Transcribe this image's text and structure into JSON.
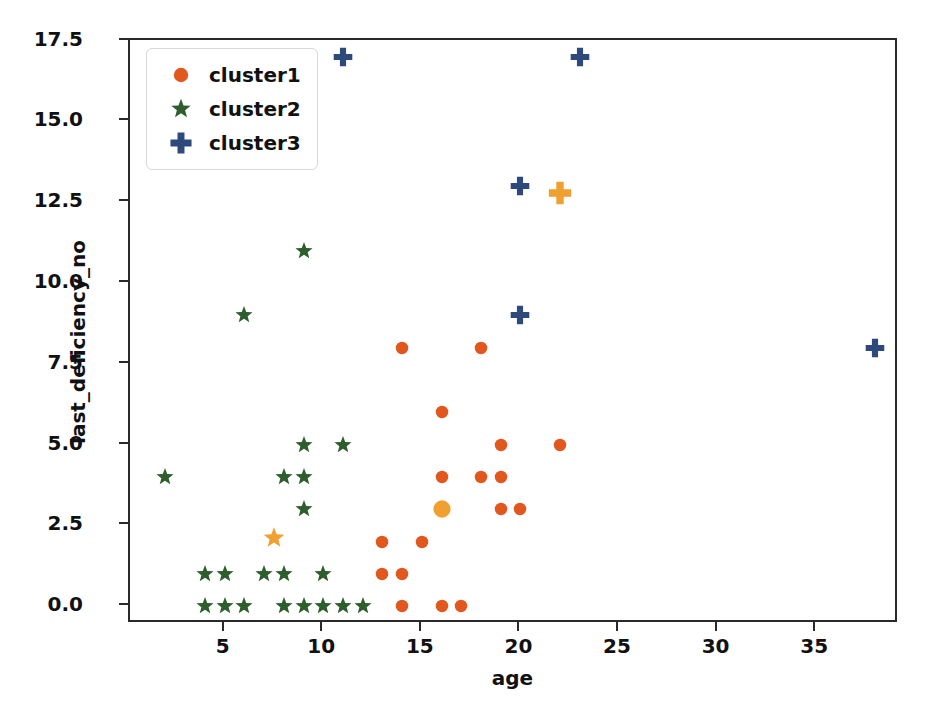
{
  "chart_data": {
    "type": "scatter",
    "title": "",
    "xlabel": "age",
    "ylabel": "last_deficiency_no",
    "xlim": [
      0.2,
      39.2
    ],
    "ylim": [
      -0.55,
      17.52
    ],
    "grid": false,
    "legend_position": "upper left",
    "xticks": [
      5,
      10,
      15,
      20,
      25,
      30,
      35
    ],
    "yticks": [
      "0.0",
      "2.5",
      "5.0",
      "7.5",
      "10.0",
      "12.5",
      "15.0",
      "17.5"
    ],
    "ytick_values": [
      0.0,
      2.5,
      5.0,
      7.5,
      10.0,
      12.5,
      15.0,
      17.5
    ],
    "series": [
      {
        "name": "cluster1",
        "marker": "circle",
        "color": "#e2571e",
        "size": 13,
        "points": [
          [
            14,
            8
          ],
          [
            18,
            8
          ],
          [
            16,
            6
          ],
          [
            19,
            5
          ],
          [
            22,
            5
          ],
          [
            16,
            4
          ],
          [
            18,
            4
          ],
          [
            19,
            4
          ],
          [
            19,
            3
          ],
          [
            20,
            3
          ],
          [
            13,
            2
          ],
          [
            15,
            2
          ],
          [
            13,
            1
          ],
          [
            14,
            1
          ],
          [
            14,
            0
          ],
          [
            16,
            0
          ],
          [
            17,
            0
          ]
        ]
      },
      {
        "name": "cluster2",
        "marker": "star",
        "color": "#2e5e2e",
        "size": 15,
        "points": [
          [
            9,
            11
          ],
          [
            6,
            9
          ],
          [
            9,
            5
          ],
          [
            11,
            5
          ],
          [
            8,
            4
          ],
          [
            9,
            4
          ],
          [
            2,
            4
          ],
          [
            9,
            3
          ],
          [
            4,
            1
          ],
          [
            5,
            1
          ],
          [
            7,
            1
          ],
          [
            8,
            1
          ],
          [
            10,
            1
          ],
          [
            4,
            0
          ],
          [
            5,
            0
          ],
          [
            6,
            0
          ],
          [
            8,
            0
          ],
          [
            9,
            0
          ],
          [
            10,
            0
          ],
          [
            11,
            0
          ],
          [
            12,
            0
          ]
        ]
      },
      {
        "name": "cluster3",
        "marker": "plus",
        "color": "#2e4a7d",
        "size": 15,
        "points": [
          [
            11,
            17
          ],
          [
            23,
            17
          ],
          [
            20,
            13
          ],
          [
            20,
            9
          ],
          [
            38,
            8
          ]
        ]
      },
      {
        "name": "centroids",
        "marker": "mixed",
        "color": "#f0a030",
        "size": 18,
        "in_legend": false,
        "points": [
          {
            "x": 16,
            "y": 3,
            "marker": "circle"
          },
          {
            "x": 7.5,
            "y": 2.1,
            "marker": "star"
          },
          {
            "x": 22,
            "y": 12.8,
            "marker": "plus"
          }
        ]
      }
    ],
    "legend_entries": [
      {
        "label": "cluster1",
        "marker": "circle",
        "color": "#e2571e"
      },
      {
        "label": "cluster2",
        "marker": "star",
        "color": "#2e5e2e"
      },
      {
        "label": "cluster3",
        "marker": "plus",
        "color": "#2e4a7d"
      }
    ]
  }
}
